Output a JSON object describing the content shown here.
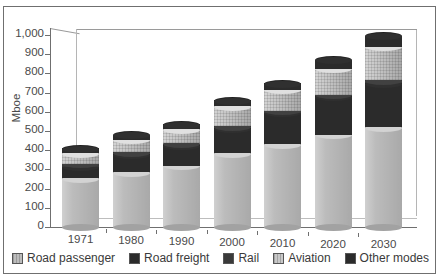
{
  "chart_data": {
    "type": "bar",
    "subtype": "stacked-column-3d-cylinder",
    "title": "",
    "xlabel": "",
    "ylabel": "Mboe",
    "categories": [
      "1971",
      "1980",
      "1990",
      "2000",
      "2010",
      "2020",
      "2030"
    ],
    "series": [
      {
        "name": "Road passenger",
        "color": "#bcbcbc",
        "values": [
          255,
          285,
          320,
          385,
          430,
          480,
          520
        ]
      },
      {
        "name": "Road freight",
        "color": "#2b2b2b",
        "values": [
          60,
          95,
          105,
          130,
          165,
          200,
          230
        ]
      },
      {
        "name": "Rail",
        "color": "#3a3a3a",
        "values": [
          15,
          10,
          10,
          10,
          10,
          10,
          15
        ]
      },
      {
        "name": "Aviation",
        "color": "#c8c8c8",
        "values": [
          55,
          65,
          75,
          105,
          110,
          135,
          175
        ]
      },
      {
        "name": "Other modes",
        "color": "#2b2b2b",
        "values": [
          25,
          25,
          25,
          30,
          35,
          45,
          55
        ]
      }
    ],
    "totals": [
      410,
      480,
      535,
      660,
      750,
      870,
      995
    ],
    "ylim": [
      0,
      1000
    ],
    "yticks": [
      "0",
      "100",
      "200",
      "300",
      "400",
      "500",
      "600",
      "700",
      "800",
      "900",
      "1,000"
    ],
    "ytick_values": [
      0,
      100,
      200,
      300,
      400,
      500,
      600,
      700,
      800,
      900,
      1000
    ],
    "grid": false,
    "legend_position": "bottom"
  },
  "axis": {
    "y_title": "Mboe"
  },
  "legend": {
    "items": [
      {
        "label": "Road passenger",
        "color": "#bcbcbc"
      },
      {
        "label": "Road freight",
        "color": "#2b2b2b"
      },
      {
        "label": "Rail",
        "color": "#3a3a3a"
      },
      {
        "label": "Aviation",
        "color": "#c8c8c8"
      },
      {
        "label": "Other modes",
        "color": "#2b2b2b"
      }
    ]
  }
}
